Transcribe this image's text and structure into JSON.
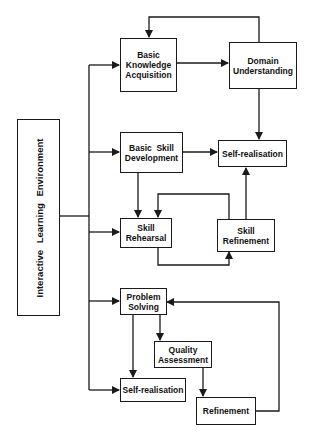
{
  "diagram": {
    "root": {
      "label": "Interactive Learning Environment"
    },
    "nodes": {
      "basic_knowledge": {
        "lines": [
          "Basic",
          "Knowledge",
          "Acquisition"
        ]
      },
      "domain_understanding": {
        "lines": [
          "Domain",
          "Understanding"
        ]
      },
      "basic_skill": {
        "lines": [
          "Basic  Skill",
          "Development"
        ]
      },
      "self_realisation_top": {
        "lines": [
          "Self-realisation"
        ]
      },
      "skill_rehearsal": {
        "lines": [
          "Skill",
          "Rehearsal"
        ]
      },
      "skill_refinement": {
        "lines": [
          "Skill",
          "Refinement"
        ]
      },
      "problem_solving": {
        "lines": [
          "Problem",
          "Solving"
        ]
      },
      "quality_assessment": {
        "lines": [
          "Quality",
          "Assessment"
        ]
      },
      "self_realisation_bottom": {
        "lines": [
          "Self-realisation"
        ]
      },
      "refinement": {
        "lines": [
          "Refinement"
        ]
      }
    },
    "edges": [
      {
        "from": "Interactive Learning Environment",
        "to": "Basic Knowledge Acquisition"
      },
      {
        "from": "Interactive Learning Environment",
        "to": "Basic Skill Development"
      },
      {
        "from": "Interactive Learning Environment",
        "to": "Skill Rehearsal"
      },
      {
        "from": "Interactive Learning Environment",
        "to": "Problem Solving"
      },
      {
        "from": "Interactive Learning Environment",
        "to": "Self-realisation (bottom)"
      },
      {
        "from": "Basic Knowledge Acquisition",
        "to": "Domain Understanding"
      },
      {
        "from": "Domain Understanding",
        "to": "Basic Knowledge Acquisition"
      },
      {
        "from": "Domain Understanding",
        "to": "Self-realisation (top)"
      },
      {
        "from": "Basic Skill Development",
        "to": "Self-realisation (top)"
      },
      {
        "from": "Basic Skill Development",
        "to": "Skill Rehearsal"
      },
      {
        "from": "Skill Rehearsal",
        "to": "Skill Refinement"
      },
      {
        "from": "Skill Refinement",
        "to": "Skill Rehearsal"
      },
      {
        "from": "Skill Refinement",
        "to": "Self-realisation (top)"
      },
      {
        "from": "Problem Solving",
        "to": "Quality Assessment"
      },
      {
        "from": "Problem Solving",
        "to": "Self-realisation (bottom)"
      },
      {
        "from": "Quality Assessment",
        "to": "Refinement"
      },
      {
        "from": "Refinement",
        "to": "Problem Solving"
      }
    ],
    "colors": {
      "line": "#1a1a1a",
      "background": "#ffffff"
    }
  }
}
